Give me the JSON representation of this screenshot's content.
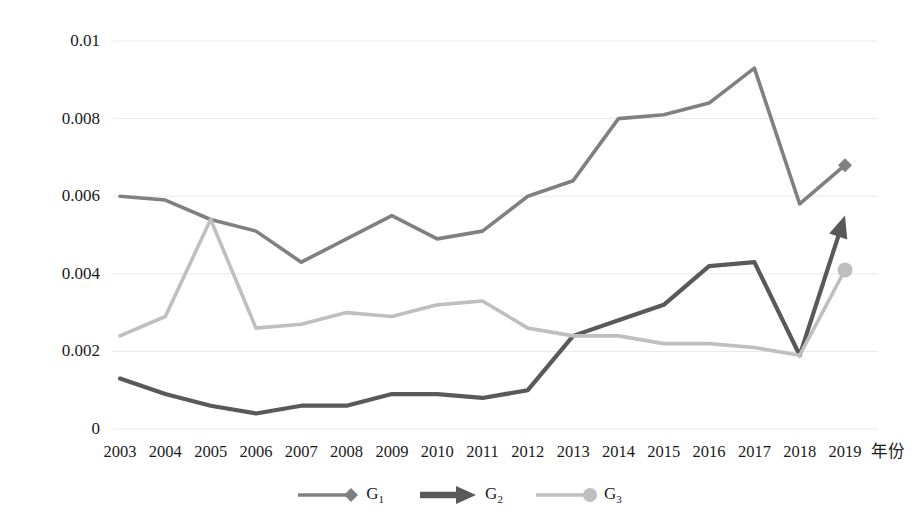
{
  "chart_data": {
    "type": "line",
    "title": "",
    "xlabel": "年份",
    "ylabel": "",
    "grid": true,
    "legend_position": "bottom",
    "x": [
      2003,
      2004,
      2005,
      2006,
      2007,
      2008,
      2009,
      2010,
      2011,
      2012,
      2013,
      2014,
      2015,
      2016,
      2017,
      2018,
      2019
    ],
    "categories": [
      "2003",
      "2004",
      "2005",
      "2006",
      "2007",
      "2008",
      "2009",
      "2010",
      "2011",
      "2012",
      "2013",
      "2014",
      "2015",
      "2016",
      "2017",
      "2018",
      "2019"
    ],
    "ylim": [
      0,
      0.01
    ],
    "yticks": [
      0,
      0.002,
      0.004,
      0.006,
      0.008,
      0.01
    ],
    "ytick_labels": [
      "0",
      "0.002",
      "0.004",
      "0.006",
      "0.008",
      "0.01"
    ],
    "series": [
      {
        "name": "G1",
        "label": "G",
        "sub": "1",
        "color": "#808080",
        "marker": "diamond",
        "marker_at_end": true,
        "values": [
          0.006,
          0.0059,
          0.0054,
          0.0051,
          0.0043,
          0.0049,
          0.0055,
          0.0049,
          0.0051,
          0.006,
          0.0064,
          0.008,
          0.0081,
          0.0084,
          0.0093,
          0.0058,
          0.0068
        ]
      },
      {
        "name": "G2",
        "label": "G",
        "sub": "2",
        "color": "#595959",
        "marker": "arrow",
        "marker_at_end": true,
        "values": [
          0.0013,
          0.0009,
          0.0006,
          0.0004,
          0.0006,
          0.0006,
          0.0009,
          0.0009,
          0.0008,
          0.001,
          0.0024,
          0.0028,
          0.0032,
          0.0042,
          0.0043,
          0.0019,
          0.0055
        ]
      },
      {
        "name": "G3",
        "label": "G",
        "sub": "3",
        "color": "#bfbfbf",
        "marker": "circle",
        "marker_at_end": true,
        "values": [
          0.0024,
          0.0029,
          0.0054,
          0.0026,
          0.0027,
          0.003,
          0.0029,
          0.0032,
          0.0033,
          0.0026,
          0.0024,
          0.0024,
          0.0022,
          0.0022,
          0.0021,
          0.0019,
          0.0041
        ]
      }
    ]
  },
  "axis": {
    "x_title": "年份"
  },
  "legend": {
    "items": [
      {
        "name": "G1",
        "label": "G",
        "sub": "1"
      },
      {
        "name": "G2",
        "label": "G",
        "sub": "2"
      },
      {
        "name": "G3",
        "label": "G",
        "sub": "3"
      }
    ]
  },
  "colors": {
    "series_g1": "#808080",
    "series_g2": "#595959",
    "series_g3": "#bfbfbf",
    "gridline": "#e8e8e8",
    "text": "#1a1a1a",
    "background": "#ffffff"
  }
}
